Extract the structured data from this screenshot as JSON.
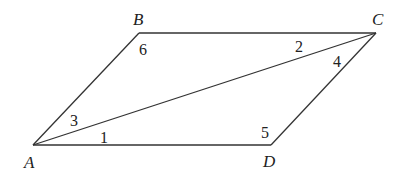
{
  "diagram": {
    "type": "parallelogram",
    "vertices": [
      {
        "name": "A",
        "x": 33,
        "y": 145,
        "label_x": 24,
        "label_y": 168
      },
      {
        "name": "B",
        "x": 139,
        "y": 33,
        "label_x": 133,
        "label_y": 25
      },
      {
        "name": "C",
        "x": 376,
        "y": 33,
        "label_x": 372,
        "label_y": 25
      },
      {
        "name": "D",
        "x": 271,
        "y": 145,
        "label_x": 263,
        "label_y": 167
      }
    ],
    "edges": [
      [
        "A",
        "B"
      ],
      [
        "B",
        "C"
      ],
      [
        "C",
        "D"
      ],
      [
        "D",
        "A"
      ],
      [
        "A",
        "C"
      ]
    ],
    "angle_labels": [
      {
        "label": "1",
        "x": 100,
        "y": 143
      },
      {
        "label": "2",
        "x": 295,
        "y": 52
      },
      {
        "label": "3",
        "x": 70,
        "y": 126
      },
      {
        "label": "4",
        "x": 333,
        "y": 67
      },
      {
        "label": "5",
        "x": 261,
        "y": 138
      },
      {
        "label": "6",
        "x": 139,
        "y": 55
      }
    ]
  }
}
